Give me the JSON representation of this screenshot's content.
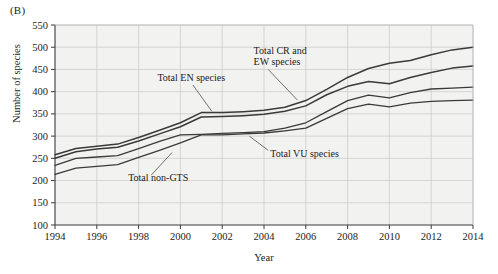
{
  "figure": {
    "panel_label": "(B)",
    "xlabel": "Year",
    "ylabel": "Number of species"
  },
  "chart_data": {
    "type": "line",
    "title": "",
    "subtitle": "",
    "panel": "(B)",
    "xlabel": "Year",
    "ylabel": "Number of species",
    "xlim": [
      1994,
      2014
    ],
    "ylim": [
      100,
      550
    ],
    "xticks": [
      1994,
      1996,
      1998,
      2000,
      2002,
      2004,
      2006,
      2008,
      2010,
      2012,
      2014
    ],
    "yticks": [
      100,
      150,
      200,
      250,
      300,
      350,
      400,
      450,
      500,
      550
    ],
    "grid": true,
    "legend_position": "inline-annotations",
    "plot_background": "#f2f2f0",
    "line_color": "#3a3a3a",
    "x": [
      1994,
      1995,
      1996,
      1997,
      1998,
      1999,
      2000,
      2001,
      2002,
      2003,
      2004,
      2005,
      2006,
      2007,
      2008,
      2009,
      2010,
      2011,
      2012,
      2013,
      2014
    ],
    "series": [
      {
        "name": "Total CR and EW species",
        "label": "Total CR and EW species",
        "values": [
          258,
          272,
          277,
          282,
          297,
          313,
          330,
          353,
          353,
          355,
          358,
          365,
          380,
          405,
          432,
          452,
          464,
          470,
          483,
          494,
          500
        ]
      },
      {
        "name": "Total EN species",
        "label": "Total EN species",
        "values": [
          250,
          265,
          271,
          275,
          289,
          305,
          321,
          343,
          344,
          346,
          349,
          356,
          368,
          393,
          412,
          423,
          418,
          432,
          443,
          453,
          458
        ]
      },
      {
        "name": "Total VU species",
        "label": "Total VU species",
        "values": [
          234,
          250,
          253,
          256,
          272,
          288,
          303,
          304,
          306,
          308,
          310,
          318,
          330,
          355,
          380,
          392,
          386,
          398,
          406,
          408,
          410
        ]
      },
      {
        "name": "Total non-GTS",
        "label": "Total non-GTS",
        "values": [
          214,
          228,
          232,
          236,
          252,
          268,
          285,
          303,
          303,
          305,
          307,
          312,
          318,
          340,
          362,
          372,
          366,
          374,
          378,
          380,
          381
        ]
      }
    ],
    "annotations": [
      {
        "text": "Total EN species",
        "x": 1999.3,
        "y": 432
      },
      {
        "text": "Total CR and EW species",
        "line1": "Total CR and EW species",
        "x": 2004.5,
        "y": 480
      },
      {
        "text": "Total VU species",
        "x": 2004.9,
        "y": 262
      },
      {
        "text": "Total non-GTS",
        "x": 1998.3,
        "y": 207
      }
    ]
  }
}
